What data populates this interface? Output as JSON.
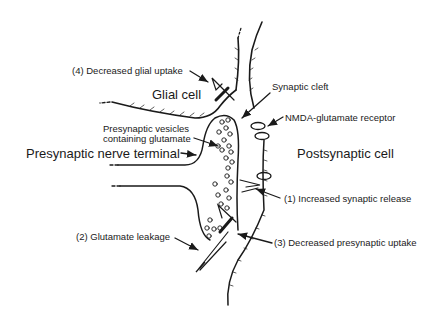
{
  "diagram": {
    "regions": {
      "glial_cell": "Glial cell",
      "presynaptic_terminal": "Presynaptic nerve terminal",
      "postsynaptic_cell": "Postsynaptic cell"
    },
    "structures": {
      "synaptic_cleft": "Synaptic cleft",
      "nmda_receptor": "NMDA-glutamate receptor",
      "vesicles_line1": "Presynaptic vesicles",
      "vesicles_line2": "containing glutamate"
    },
    "mechanisms": [
      {
        "label": "(1) Increased synaptic release"
      },
      {
        "label": "(2) Glutamate leakage"
      },
      {
        "label": "(3) Decreased presynaptic uptake"
      },
      {
        "label": "(4) Decreased glial uptake"
      }
    ],
    "colors": {
      "ink": "#1a1a1a",
      "background": "#ffffff"
    }
  }
}
